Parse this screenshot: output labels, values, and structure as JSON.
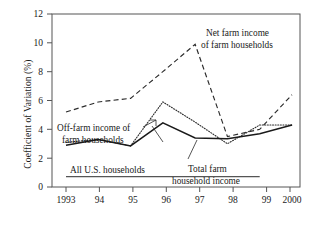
{
  "chart_data": {
    "type": "line",
    "title": "",
    "xlabel": "",
    "ylabel": "Coefficient of Variation (%)",
    "xlim": [
      1993,
      2000
    ],
    "ylim": [
      0,
      12
    ],
    "grid": false,
    "legend_position": "inline-annotations",
    "x": [
      1993,
      1994,
      1995,
      1996,
      1997,
      1998,
      1999,
      2000
    ],
    "xtick_labels": [
      "1993",
      "94",
      "95",
      "96",
      "97",
      "98",
      "99",
      "2000"
    ],
    "ytick_labels": [
      "0",
      "2",
      "4",
      "6",
      "8",
      "10",
      "12"
    ],
    "ytick_values": [
      0,
      2,
      4,
      6,
      8,
      10,
      12
    ],
    "series": [
      {
        "name": "Net farm income of farm households",
        "style": "dashed",
        "values": [
          5.2,
          5.9,
          6.15,
          8.0,
          9.9,
          3.5,
          4.0,
          6.4
        ]
      },
      {
        "name": "Off-farm income of farm households",
        "style": "dotted",
        "values": [
          3.1,
          3.3,
          2.85,
          5.9,
          4.5,
          3.0,
          4.3,
          4.3
        ]
      },
      {
        "name": "Total farm household income",
        "style": "solid",
        "values": [
          2.9,
          3.3,
          2.85,
          4.45,
          3.4,
          3.35,
          3.7,
          4.3
        ]
      },
      {
        "name": "All U.S. households",
        "style": "solid-flat",
        "values": [
          0.72,
          0.72,
          0.72,
          0.72,
          0.72,
          0.72,
          0.72,
          0.72
        ],
        "x_extent": [
          1993,
          1999
        ]
      }
    ],
    "annotations": [
      {
        "key": "net_farm",
        "line1": "Net farm income",
        "line2": "of farm households"
      },
      {
        "key": "off_farm",
        "line1": "Off-farm income of",
        "line2": "farm households"
      },
      {
        "key": "total_farm",
        "line1": "Total farm",
        "line2": "household income"
      },
      {
        "key": "all_us",
        "line1": "All U.S. households",
        "line2": ""
      }
    ]
  }
}
